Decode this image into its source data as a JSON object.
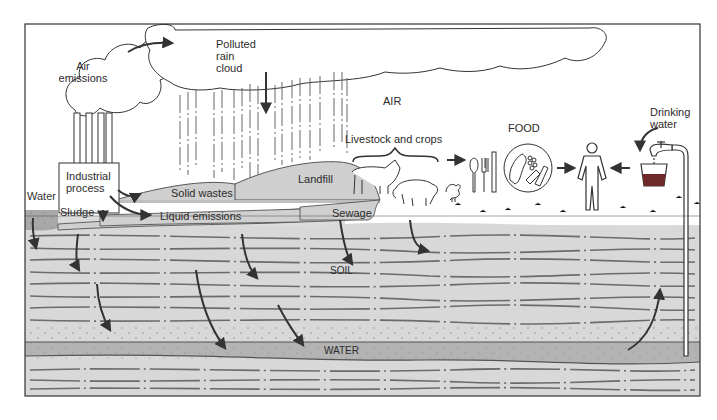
{
  "diagram": {
    "regions": {
      "air": "AIR",
      "soil": "SOIL",
      "water": "WATER",
      "food": "FOOD"
    },
    "labels": {
      "air_emissions": [
        "Air",
        "emissions"
      ],
      "polluted_rain_cloud": [
        "Polluted",
        "rain",
        "cloud"
      ],
      "industrial_process": [
        "Industrial",
        "process"
      ],
      "solid_wastes": "Solid wastes",
      "landfill": "Landfill",
      "water_surface": "Water",
      "sludge": "Sludge",
      "liquid_emissions": "Liquid emissions",
      "sewage": "Sewage",
      "livestock_and_crops": "Livestock and crops",
      "drinking_water": [
        "Drinking",
        "water"
      ]
    },
    "colors": {
      "frame": "#333333",
      "air_bg": "#ffffff",
      "ground_surface": "#d4d4d4",
      "soil_fill": "#dcdcdc",
      "soil_lines": "#6b6b6b",
      "water_band": "#b3b3b3",
      "waste_fill": "#d0d0d0",
      "surface_water": "#a8a8a8",
      "drink_fill": "#6e2a2a",
      "arrow": "#333333"
    },
    "flows": [
      {
        "from": "Industrial process",
        "to": "Air emissions"
      },
      {
        "from": "Air emissions",
        "to": "Polluted rain cloud"
      },
      {
        "from": "Polluted rain cloud",
        "to": "Ground (rain)"
      },
      {
        "from": "Industrial process",
        "to": "Solid wastes"
      },
      {
        "from": "Industrial process",
        "to": "Sludge"
      },
      {
        "from": "Industrial process",
        "to": "Liquid emissions"
      },
      {
        "from": "Surface water / Sludge / Sewage",
        "to": "SOIL"
      },
      {
        "from": "SOIL",
        "to": "WATER"
      },
      {
        "from": "Livestock and crops",
        "to": "FOOD"
      },
      {
        "from": "FOOD",
        "to": "Human"
      },
      {
        "from": "WATER",
        "to": "Drinking water"
      },
      {
        "from": "Drinking water",
        "to": "Human"
      }
    ]
  }
}
